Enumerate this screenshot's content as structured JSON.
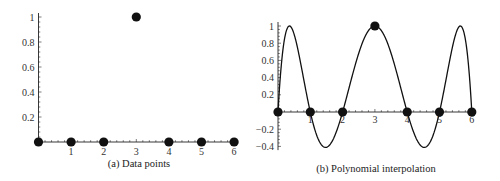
{
  "chart_data": [
    {
      "type": "scatter",
      "caption": "(a) Data points",
      "x": [
        0,
        1,
        2,
        3,
        4,
        5,
        6
      ],
      "y": [
        0,
        0,
        0,
        1,
        0,
        0,
        0
      ],
      "xticks": [
        "1",
        "2",
        "3",
        "4",
        "5",
        "6"
      ],
      "yticks": [
        "0.2",
        "0.4",
        "0.6",
        "0.8",
        "1"
      ],
      "xlim": [
        0,
        6
      ],
      "ylim": [
        0,
        1
      ],
      "grid": false
    },
    {
      "type": "line",
      "caption": "(b) Polynomial interpolation",
      "points_x": [
        0,
        1,
        2,
        3,
        4,
        5,
        6
      ],
      "points_y": [
        0,
        0,
        0,
        1,
        0,
        0,
        0
      ],
      "curve": "interpolating polynomial p(x) = x(x-1)(x-2)(x-4)(x-5)(x-6) / -36",
      "curve_roots": [
        0,
        1,
        2,
        4,
        5,
        6
      ],
      "curve_scale": -36,
      "xticks": [
        "1",
        "2",
        "3",
        "4",
        "5",
        "6"
      ],
      "yticks": [
        "-0.4",
        "-0.2",
        "0.2",
        "0.4",
        "0.6",
        "0.8",
        "1"
      ],
      "xlim": [
        0,
        6
      ],
      "ylim": [
        -0.42,
        1
      ],
      "grid": false
    }
  ]
}
